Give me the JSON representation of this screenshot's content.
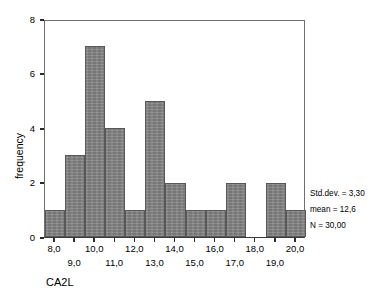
{
  "chart_data": {
    "type": "bar",
    "title": "",
    "xlabel": "CA2L",
    "ylabel": "frequency",
    "categories": [
      "8,0",
      "9,0",
      "10,0",
      "11,0",
      "12,0",
      "13,0",
      "14,0",
      "15,0",
      "16,0",
      "17,0",
      "18,0",
      "19,0",
      "20,0"
    ],
    "bin_starts": [
      8.0,
      9.0,
      10.0,
      11.0,
      12.0,
      13.0,
      14.0,
      15.0,
      16.0,
      17.0,
      18.0,
      19.0,
      20.0
    ],
    "bin_width": 1.0,
    "values": [
      1,
      3,
      7,
      4,
      1,
      5,
      2,
      1,
      1,
      2,
      0,
      2,
      1
    ],
    "ylim": [
      0,
      8
    ],
    "xlim": [
      7.5,
      20.5
    ],
    "yticks": [
      0,
      2,
      4,
      6,
      8
    ],
    "ytick_labels": [
      "0",
      "2",
      "4",
      "6",
      "8"
    ],
    "xticks": [
      8.0,
      9.0,
      10.0,
      11.0,
      12.0,
      13.0,
      14.0,
      15.0,
      16.0,
      17.0,
      18.0,
      19.0,
      20.0
    ],
    "xtick_labels_upper": [
      "8,0",
      "10,0",
      "12,0",
      "14,0",
      "16,0",
      "18,0",
      "20,0"
    ],
    "xtick_values_upper": [
      8.0,
      10.0,
      12.0,
      14.0,
      16.0,
      18.0,
      20.0
    ],
    "xtick_labels_lower": [
      "9,0",
      "11,0",
      "13,0",
      "15,0",
      "17,0",
      "19,0"
    ],
    "xtick_values_lower": [
      9.0,
      11.0,
      13.0,
      15.0,
      17.0,
      19.0
    ],
    "grid": false,
    "legend": false,
    "bar_fill_color": "#808080",
    "bar_edge_color": "#585858",
    "axis_color": "#6f6f6f"
  },
  "axes": {
    "y_title": "frequency",
    "x_title": "CA2L",
    "y_labels": [
      "0",
      "2",
      "4",
      "6",
      "8"
    ],
    "x_labels_upper": [
      "8,0",
      "10,0",
      "12,0",
      "14,0",
      "16,0",
      "18,0",
      "20,0"
    ],
    "x_labels_lower": [
      "9,0",
      "11,0",
      "13,0",
      "15,0",
      "17,0",
      "19,0"
    ]
  },
  "stats": {
    "std_dev": "Std.dev. = 3,30",
    "mean": "mean = 12,6",
    "n": "N = 30,00"
  }
}
